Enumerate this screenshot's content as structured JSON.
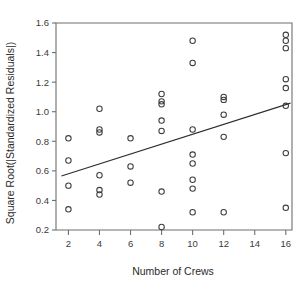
{
  "chart_data": {
    "type": "scatter",
    "title": "",
    "xlabel": "Number of Crews",
    "ylabel": "Square Root(|Standardized Residuals|)",
    "xlim": [
      1.2,
      16.4
    ],
    "ylim": [
      0.2,
      1.6
    ],
    "xticks": [
      2,
      4,
      6,
      8,
      10,
      12,
      14,
      16
    ],
    "xticklabels": [
      "2",
      "4",
      "6",
      "8",
      "10",
      "12",
      "14",
      "16"
    ],
    "yticks": [
      0.2,
      0.4,
      0.6,
      0.8,
      1.0,
      1.2,
      1.4,
      1.6
    ],
    "yticklabels": [
      "0.2",
      "0.4",
      "0.6",
      "0.8",
      "1.0",
      "1.2",
      "1.4",
      "1.6"
    ],
    "grid": false,
    "legend": null,
    "marker": "open-circle",
    "marker_color": "#3d3d3d",
    "points": [
      {
        "x": 2,
        "y": 0.82
      },
      {
        "x": 2,
        "y": 0.67
      },
      {
        "x": 2,
        "y": 0.5
      },
      {
        "x": 2,
        "y": 0.34
      },
      {
        "x": 4,
        "y": 1.02
      },
      {
        "x": 4,
        "y": 0.88
      },
      {
        "x": 4,
        "y": 0.86
      },
      {
        "x": 4,
        "y": 0.57
      },
      {
        "x": 4,
        "y": 0.47
      },
      {
        "x": 4,
        "y": 0.44
      },
      {
        "x": 6,
        "y": 0.82
      },
      {
        "x": 6,
        "y": 0.63
      },
      {
        "x": 6,
        "y": 0.52
      },
      {
        "x": 8,
        "y": 1.12
      },
      {
        "x": 8,
        "y": 1.07
      },
      {
        "x": 8,
        "y": 1.05
      },
      {
        "x": 8,
        "y": 0.94
      },
      {
        "x": 8,
        "y": 0.87
      },
      {
        "x": 8,
        "y": 0.46
      },
      {
        "x": 8,
        "y": 0.22
      },
      {
        "x": 10,
        "y": 1.48
      },
      {
        "x": 10,
        "y": 1.33
      },
      {
        "x": 10,
        "y": 0.88
      },
      {
        "x": 10,
        "y": 0.71
      },
      {
        "x": 10,
        "y": 0.65
      },
      {
        "x": 10,
        "y": 0.54
      },
      {
        "x": 10,
        "y": 0.48
      },
      {
        "x": 10,
        "y": 0.32
      },
      {
        "x": 12,
        "y": 1.1
      },
      {
        "x": 12,
        "y": 1.08
      },
      {
        "x": 12,
        "y": 0.98
      },
      {
        "x": 12,
        "y": 0.83
      },
      {
        "x": 12,
        "y": 0.32
      },
      {
        "x": 16,
        "y": 1.52
      },
      {
        "x": 16,
        "y": 1.48
      },
      {
        "x": 16,
        "y": 1.43
      },
      {
        "x": 16,
        "y": 1.22
      },
      {
        "x": 16,
        "y": 1.16
      },
      {
        "x": 16,
        "y": 1.04
      },
      {
        "x": 16,
        "y": 0.72
      },
      {
        "x": 16,
        "y": 0.35
      }
    ],
    "fit_line": {
      "type": "linear",
      "color": "#2e2e2e",
      "x_start": 1.55,
      "y_start": 0.565,
      "x_end": 16.3,
      "y_end": 1.058
    }
  }
}
